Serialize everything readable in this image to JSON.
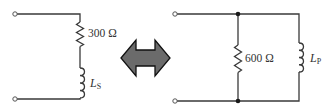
{
  "diagram": {
    "type": "series-parallel circuit equivalence",
    "series_circuit": {
      "resistor": {
        "label": "300 Ω",
        "value": "300",
        "unit": "Ω"
      },
      "inductor": {
        "label_main": "L",
        "label_sub": "S"
      }
    },
    "equivalence_arrow": {
      "icon": "double-headed-arrow",
      "fill": "#6b6b6b",
      "outline": "#111111"
    },
    "parallel_circuit": {
      "resistor": {
        "label": "600 Ω",
        "value": "600",
        "unit": "Ω"
      },
      "inductor": {
        "label_main": "L",
        "label_sub": "P"
      }
    },
    "colors": {
      "wire": "#3a3a3a",
      "text": "#333333",
      "background": "#ffffff"
    }
  }
}
